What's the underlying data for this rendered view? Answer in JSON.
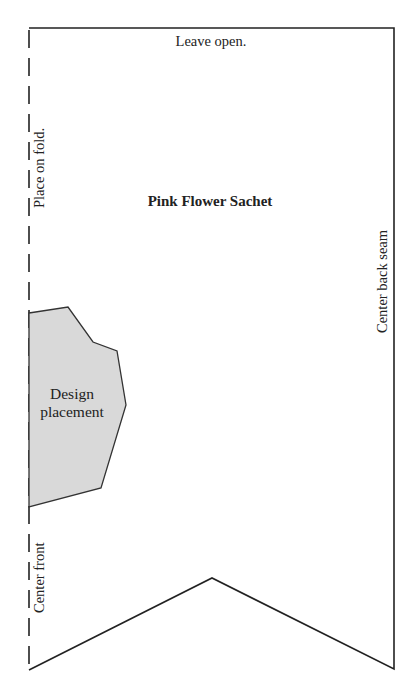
{
  "pattern": {
    "title": "Pink Flower Sachet",
    "labels": {
      "top_edge": "Leave open.",
      "left_edge_fold": "Place on fold.",
      "left_edge_front": "Center front",
      "right_edge": "Center back seam",
      "design_area": "Design placement"
    },
    "colors": {
      "outline": "#222222",
      "design_fill": "#d9d9d9",
      "background": "#ffffff"
    }
  }
}
